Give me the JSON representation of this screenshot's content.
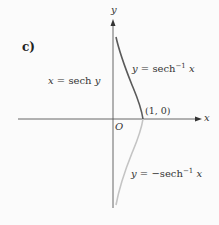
{
  "figure": {
    "part_label": "c)",
    "axes": {
      "x_label": "x",
      "y_label": "y",
      "origin_label": "O"
    },
    "point_label": "(1, 0)",
    "equations": {
      "left": {
        "lhs": "x",
        "eq": " = ",
        "rhs_fn": "sech ",
        "rhs_var": "y"
      },
      "upper": {
        "lhs": "y",
        "eq": " = ",
        "fn": "sech",
        "sup": "−1",
        "var": " x"
      },
      "lower": {
        "lhs": "y",
        "eq": " = −",
        "fn": "sech",
        "sup": "−1",
        "var": " x"
      }
    },
    "colors": {
      "axis": "#555555",
      "upper_curve": "#5a5a5a",
      "lower_curve": "#c4c4c4"
    }
  }
}
